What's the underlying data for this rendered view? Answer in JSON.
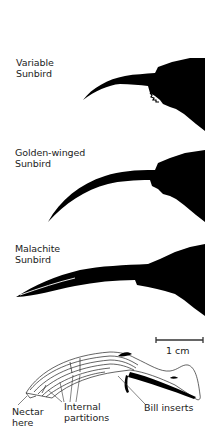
{
  "figure": {
    "species": [
      {
        "name_line1": "Variable",
        "name_line2": "Sunbird"
      },
      {
        "name_line1": "Golden-winged",
        "name_line2": "Sunbird"
      },
      {
        "name_line1": "Malachite",
        "name_line2": "Sunbird"
      }
    ],
    "scale_bar": {
      "label": "1 cm"
    },
    "diagram": {
      "callouts": {
        "nectar": {
          "line1": "Nectar",
          "line2": "here"
        },
        "partitions": {
          "line1": "Internal",
          "line2": "partitions"
        },
        "inserts": {
          "line1": "Bill inserts"
        }
      }
    },
    "colors": {
      "silhouette": "#000000",
      "background": "#ffffff",
      "line": "#333333"
    }
  }
}
